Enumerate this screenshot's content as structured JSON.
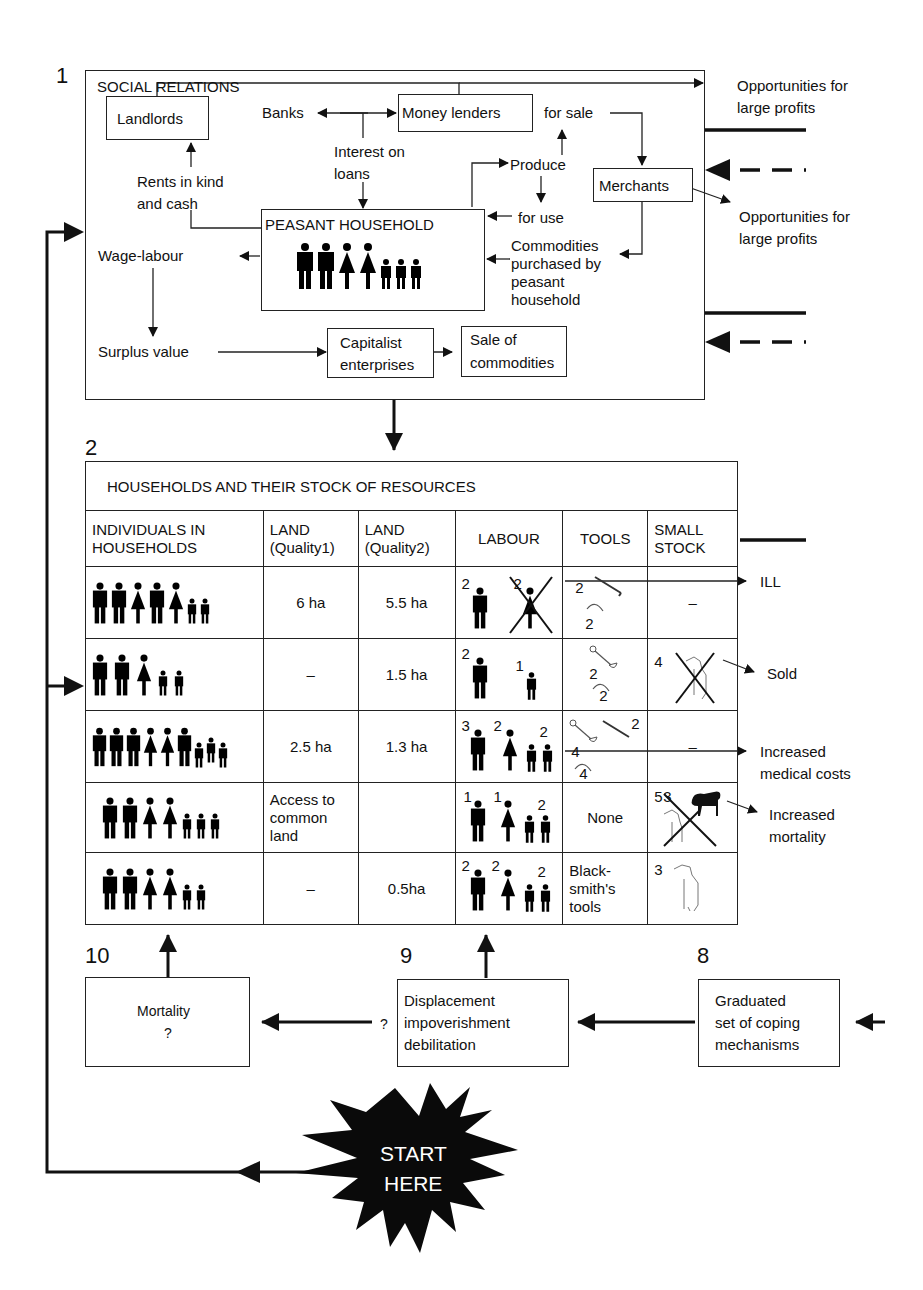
{
  "section1": {
    "number": "1",
    "title": "SOCIAL RELATIONS",
    "nodes": {
      "landlords": "Landlords",
      "banks": "Banks",
      "money_lenders": "Money lenders",
      "interest_on_loans_1": "Interest on",
      "interest_on_loans_2": "loans",
      "rents_1": "Rents in kind",
      "rents_2": "and cash",
      "peasant_household": "PEASANT HOUSEHOLD",
      "wage_labour": "Wage-labour",
      "surplus_value": "Surplus value",
      "capitalist_1": "Capitalist",
      "capitalist_2": "enterprises",
      "sale_1": "Sale of",
      "sale_2": "commodities",
      "for_sale": "for sale",
      "produce": "Produce",
      "for_use": "for use",
      "merchants": "Merchants",
      "commodities_1": "Commodities",
      "commodities_2": "purchased by",
      "commodities_3": "peasant",
      "commodities_4": "household"
    },
    "outputs": {
      "opp1_line1": "Opportunities for",
      "opp1_line2": "large profits",
      "opp2_line1": "Opportunities for",
      "opp2_line2": "large profits"
    }
  },
  "section2": {
    "number": "2",
    "title": "HOUSEHOLDS AND THEIR STOCK OF RESOURCES",
    "columns": [
      {
        "line1": "INDIVIDUALS IN",
        "line2": "HOUSEHOLDS"
      },
      {
        "line1": "LAND",
        "line2": "(Quality1)"
      },
      {
        "line1": "LAND",
        "line2": "(Quality2)"
      },
      {
        "line1": "LABOUR",
        "line2": ""
      },
      {
        "line1": "TOOLS",
        "line2": ""
      },
      {
        "line1": "SMALL",
        "line2": "STOCK"
      }
    ],
    "rows": [
      {
        "individuals": "2 men, 2 women, 1 man, 2 children",
        "land_q1": "6 ha",
        "land_q2": "5.5 ha",
        "labour": {
          "men": "2",
          "women": "2",
          "women_ill": true
        },
        "tools": {
          "hoe": "2",
          "sickle": "2"
        },
        "small_stock": "–",
        "outcome": "ILL"
      },
      {
        "individuals": "2 men, 1 woman, 2 children",
        "land_q1": "–",
        "land_q2": "1.5 ha",
        "labour": {
          "men": "2",
          "children": "1"
        },
        "tools": {
          "spade": "2",
          "sickle": "2"
        },
        "small_stock": {
          "count": "4",
          "animal": "goat",
          "crossed": true
        },
        "outcome": "Sold"
      },
      {
        "individuals": "3 men, 2 women, 2 men, 3 children",
        "land_q1": "2.5 ha",
        "land_q2": "1.3 ha",
        "labour": {
          "men": "3",
          "women": "2",
          "children": "2"
        },
        "tools": {
          "hoe": "2",
          "spade": "4",
          "sickle": "4"
        },
        "small_stock": "–",
        "outcome_line1": "Increased",
        "outcome_line2": "medical costs"
      },
      {
        "individuals": "2 men, 2 women, 3 children",
        "land_q1_line1": "Access to",
        "land_q1_line2": "common",
        "land_q1_line3": "land",
        "land_q2": "",
        "labour": {
          "men": "1",
          "women": "1",
          "children": "2"
        },
        "tools": "None",
        "small_stock": {
          "count": "5",
          "crossed_count": "3",
          "animal": "goat/sheep",
          "crossed": true
        },
        "outcome_line1": "Increased",
        "outcome_line2": "mortality"
      },
      {
        "individuals": "2 men, 2 women, 2 children",
        "land_q1": "–",
        "land_q2": "0.5ha",
        "labour": {
          "men": "2",
          "women": "2",
          "children": "2"
        },
        "tools_line1": "Black-",
        "tools_line2": "smith's",
        "tools_line3": "tools",
        "small_stock": {
          "count": "3",
          "animal": "goat"
        }
      }
    ]
  },
  "section10": {
    "number": "10",
    "line1": "Mortality",
    "line2": "?"
  },
  "section9": {
    "number": "9",
    "line1": "Displacement",
    "line2": "impoverishment",
    "line3": "debilitation",
    "question": "?"
  },
  "section8": {
    "number": "8",
    "line1": "Graduated",
    "line2": "set of coping",
    "line3": "mechanisms"
  },
  "start": {
    "line1": "START",
    "line2": "HERE"
  }
}
